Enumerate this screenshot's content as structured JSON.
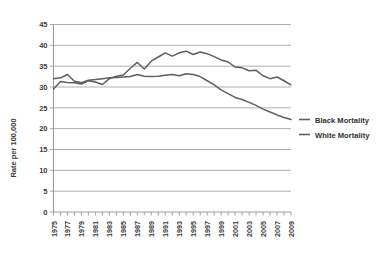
{
  "chart_data": {
    "type": "line",
    "title": "",
    "xlabel": "",
    "ylabel": "Rate per 100,000",
    "ylim": [
      0,
      45
    ],
    "ytick_step": 5,
    "yticks": [
      "0",
      "5",
      "10",
      "15",
      "20",
      "25",
      "30",
      "35",
      "40",
      "45"
    ],
    "grid": true,
    "legend_position": "right",
    "x": [
      1975,
      1976,
      1977,
      1978,
      1979,
      1980,
      1981,
      1982,
      1983,
      1984,
      1985,
      1986,
      1987,
      1988,
      1989,
      1990,
      1991,
      1992,
      1993,
      1994,
      1995,
      1996,
      1997,
      1998,
      1999,
      2000,
      2001,
      2002,
      2003,
      2004,
      2005,
      2006,
      2007,
      2008,
      2009
    ],
    "xticks": [
      "1975",
      "1977",
      "1979",
      "1981",
      "1983",
      "1985",
      "1987",
      "1989",
      "1991",
      "1993",
      "1995",
      "1997",
      "1999",
      "2001",
      "2003",
      "2005",
      "2007",
      "2009"
    ],
    "series": [
      {
        "name": "Black Mortality",
        "color": "#5e5e5e",
        "values": [
          29.5,
          31.3,
          31.1,
          31.0,
          30.7,
          31.5,
          31.2,
          30.6,
          32.0,
          32.6,
          32.9,
          34.5,
          35.9,
          34.3,
          36.2,
          37.2,
          38.2,
          37.4,
          38.2,
          38.6,
          37.8,
          38.4,
          38.0,
          37.3,
          36.5,
          36.0,
          34.8,
          34.6,
          33.9,
          34.0,
          32.7,
          32.0,
          32.4,
          31.5,
          30.5
        ]
      },
      {
        "name": "White Mortality",
        "color": "#5e5e5e",
        "values": [
          32.0,
          32.2,
          33.0,
          31.4,
          31.0,
          31.6,
          31.8,
          32.0,
          32.2,
          32.3,
          32.4,
          32.5,
          33.0,
          32.6,
          32.5,
          32.6,
          32.8,
          33.0,
          32.7,
          33.2,
          33.0,
          32.5,
          31.5,
          30.5,
          29.3,
          28.4,
          27.5,
          27.0,
          26.3,
          25.6,
          24.7,
          24.0,
          23.3,
          22.7,
          22.2
        ]
      }
    ]
  },
  "legend": {
    "items": [
      {
        "label": "Black Mortality"
      },
      {
        "label": "White Mortality"
      }
    ]
  }
}
